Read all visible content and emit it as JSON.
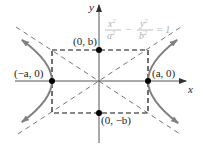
{
  "diagram": {
    "equation": {
      "num1": "x",
      "num1_exp": "2",
      "den1": "a",
      "den1_exp": "2",
      "minus": "−",
      "num2": "y",
      "num2_exp": "2",
      "den2": "b",
      "den2_exp": "2",
      "equals": "= 1"
    },
    "axes": {
      "x_label": "x",
      "y_label": "y"
    },
    "points": [
      {
        "id": "vertex-left",
        "label": "(−a, 0)"
      },
      {
        "id": "vertex-right",
        "label": "(a, 0)"
      },
      {
        "id": "co-vertex-top",
        "label": "(0, b)"
      },
      {
        "id": "co-vertex-bottom",
        "label": "(0, −b)"
      }
    ],
    "colors": {
      "axis": "#555555",
      "curve": "#808080",
      "dashed": "#111111",
      "asymptote": "#777777",
      "point": "#000000",
      "equation": "#b0b0b0"
    }
  }
}
